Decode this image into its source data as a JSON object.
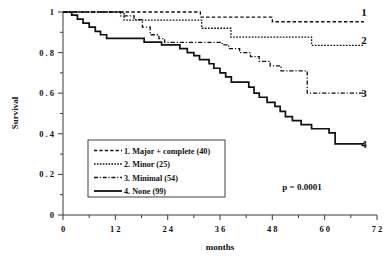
{
  "chart_data": {
    "type": "line",
    "subtype": "kaplan-meier-step",
    "title": "",
    "xlabel": "months",
    "ylabel": "Survival",
    "xlim": [
      0,
      72
    ],
    "ylim": [
      0,
      1
    ],
    "xticks": [
      0,
      12,
      24,
      36,
      48,
      60,
      72
    ],
    "xtick_labels": [
      "0",
      "1 2",
      "2 4",
      "3 6",
      "4 8",
      "6 0",
      "7 2"
    ],
    "yticks": [
      0,
      0.2,
      0.4,
      0.6,
      0.8,
      1
    ],
    "ytick_labels": [
      "0",
      "0 . 2",
      "0 . 4",
      "0 . 6",
      "0 . 8",
      "1"
    ],
    "minor_ticks": true,
    "grid": false,
    "legend_position": "lower-left-inside",
    "annotations": [
      {
        "name": "p-value",
        "text": "p  =  0.0001",
        "x": 57,
        "y": 0.2
      }
    ],
    "series": [
      {
        "name": "1. Major + complete  (40)",
        "label": "1",
        "n": 40,
        "linestyle": "dashed",
        "color": "#111111",
        "end_label": "1",
        "points": [
          [
            0,
            1.0
          ],
          [
            31.5,
            1.0
          ],
          [
            31.5,
            0.975
          ],
          [
            48.0,
            0.975
          ],
          [
            48.0,
            0.952
          ],
          [
            69.0,
            0.952
          ]
        ]
      },
      {
        "name": "2. Minor  (25)",
        "label": "2",
        "n": 25,
        "linestyle": "dotted",
        "color": "#111111",
        "end_label": "2",
        "points": [
          [
            0,
            1.0
          ],
          [
            14.0,
            1.0
          ],
          [
            14.0,
            0.96
          ],
          [
            31.8,
            0.96
          ],
          [
            31.8,
            0.92
          ],
          [
            38.5,
            0.92
          ],
          [
            38.5,
            0.876
          ],
          [
            57.0,
            0.876
          ],
          [
            57.0,
            0.836
          ],
          [
            69.0,
            0.836
          ]
        ]
      },
      {
        "name": "3. Minimal  (54)",
        "label": "3",
        "n": 54,
        "linestyle": "dashdot",
        "color": "#111111",
        "end_label": "3",
        "points": [
          [
            0,
            1.0
          ],
          [
            13.2,
            1.0
          ],
          [
            13.2,
            0.981
          ],
          [
            16.3,
            0.981
          ],
          [
            16.3,
            0.962
          ],
          [
            18.2,
            0.962
          ],
          [
            18.2,
            0.925
          ],
          [
            20.0,
            0.925
          ],
          [
            20.0,
            0.888
          ],
          [
            22.0,
            0.888
          ],
          [
            22.0,
            0.869
          ],
          [
            23.3,
            0.869
          ],
          [
            23.3,
            0.85
          ],
          [
            36.5,
            0.85
          ],
          [
            36.5,
            0.838
          ],
          [
            38.0,
            0.838
          ],
          [
            38.0,
            0.82
          ],
          [
            40.5,
            0.82
          ],
          [
            40.5,
            0.8
          ],
          [
            43.0,
            0.8
          ],
          [
            43.0,
            0.78
          ],
          [
            45.0,
            0.78
          ],
          [
            45.0,
            0.757
          ],
          [
            47.5,
            0.757
          ],
          [
            47.5,
            0.735
          ],
          [
            50.0,
            0.735
          ],
          [
            50.0,
            0.71
          ],
          [
            56.0,
            0.71
          ],
          [
            56.0,
            0.6
          ],
          [
            69.0,
            0.6
          ]
        ]
      },
      {
        "name": "4. None  (99)",
        "label": "4",
        "n": 99,
        "linestyle": "solid",
        "color": "#111111",
        "end_label": "4",
        "points": [
          [
            0,
            1.0
          ],
          [
            2.0,
            1.0
          ],
          [
            2.0,
            0.985
          ],
          [
            3.3,
            0.985
          ],
          [
            3.3,
            0.965
          ],
          [
            4.6,
            0.965
          ],
          [
            4.6,
            0.945
          ],
          [
            6.0,
            0.945
          ],
          [
            6.0,
            0.925
          ],
          [
            7.4,
            0.925
          ],
          [
            7.4,
            0.905
          ],
          [
            8.6,
            0.905
          ],
          [
            8.6,
            0.888
          ],
          [
            10.0,
            0.888
          ],
          [
            10.0,
            0.87
          ],
          [
            18.6,
            0.87
          ],
          [
            18.6,
            0.852
          ],
          [
            22.6,
            0.852
          ],
          [
            22.6,
            0.838
          ],
          [
            26.8,
            0.838
          ],
          [
            26.8,
            0.82
          ],
          [
            28.5,
            0.82
          ],
          [
            28.5,
            0.8
          ],
          [
            30.0,
            0.8
          ],
          [
            30.0,
            0.785
          ],
          [
            31.3,
            0.785
          ],
          [
            31.3,
            0.765
          ],
          [
            33.5,
            0.765
          ],
          [
            33.5,
            0.745
          ],
          [
            34.6,
            0.745
          ],
          [
            34.6,
            0.723
          ],
          [
            36.0,
            0.723
          ],
          [
            36.0,
            0.7
          ],
          [
            37.3,
            0.7
          ],
          [
            37.3,
            0.68
          ],
          [
            38.6,
            0.68
          ],
          [
            38.6,
            0.655
          ],
          [
            42.6,
            0.655
          ],
          [
            42.6,
            0.63
          ],
          [
            43.8,
            0.63
          ],
          [
            43.8,
            0.6
          ],
          [
            45.0,
            0.6
          ],
          [
            45.0,
            0.58
          ],
          [
            46.8,
            0.58
          ],
          [
            46.8,
            0.555
          ],
          [
            48.6,
            0.555
          ],
          [
            48.6,
            0.535
          ],
          [
            49.8,
            0.535
          ],
          [
            49.8,
            0.51
          ],
          [
            51.0,
            0.51
          ],
          [
            51.0,
            0.485
          ],
          [
            52.6,
            0.485
          ],
          [
            52.6,
            0.465
          ],
          [
            54.6,
            0.465
          ],
          [
            54.6,
            0.445
          ],
          [
            57.0,
            0.445
          ],
          [
            57.0,
            0.425
          ],
          [
            61.0,
            0.425
          ],
          [
            61.0,
            0.405
          ],
          [
            62.4,
            0.405
          ],
          [
            62.4,
            0.35
          ],
          [
            69.0,
            0.35
          ]
        ]
      }
    ]
  },
  "axes": {
    "y_title": "Survival",
    "x_title": "months"
  },
  "legend": {
    "items": [
      {
        "label": "1. Major + complete  (40)",
        "style": "dashed"
      },
      {
        "label": "2. Minor  (25)",
        "style": "dotted"
      },
      {
        "label": "3. Minimal  (54)",
        "style": "dashdot"
      },
      {
        "label": "4. None  (99)",
        "style": "solid"
      }
    ]
  },
  "stats": {
    "p_value_text": "p  =  0.0001"
  },
  "end_labels": {
    "s1": "1",
    "s2": "2",
    "s3": "3",
    "s4": "4"
  },
  "colors": {
    "line": "#111111",
    "axis": "#3a3a3a",
    "background": "#ffffff"
  }
}
